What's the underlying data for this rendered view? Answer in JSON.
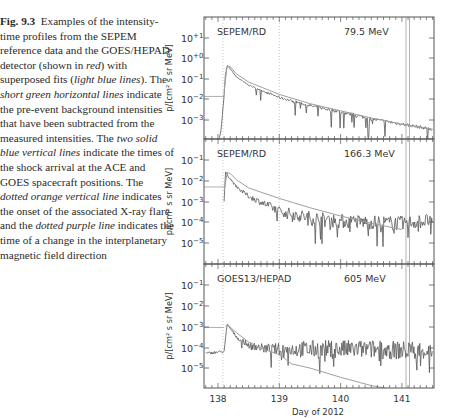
{
  "caption": {
    "label": "Fig. 9.3",
    "parts": [
      {
        "t": "Examples of the intensity-time profiles from the SEPEM reference data and the GOES/HEPAD detector (shown in ",
        "i": false
      },
      {
        "t": "red",
        "i": true
      },
      {
        "t": ") with superposed fits (",
        "i": false
      },
      {
        "t": "light blue lines",
        "i": true
      },
      {
        "t": "). The ",
        "i": false
      },
      {
        "t": "short green horizontal lines",
        "i": true
      },
      {
        "t": " indicate the pre-event background intensities that have been subtracted from the measured intensities. The ",
        "i": false
      },
      {
        "t": "two solid blue vertical lines",
        "i": true
      },
      {
        "t": " indicate the times of the shock arrival at the ACE and GOES spacecraft positions. The ",
        "i": false
      },
      {
        "t": "dotted orange vertical line",
        "i": true
      },
      {
        "t": " indicates the onset of the associated X-ray flare and the ",
        "i": false
      },
      {
        "t": "dotted purple line",
        "i": true
      },
      {
        "t": " indicates the time of a change in the interplanetary magnetic field direction",
        "i": false
      }
    ]
  },
  "chart_data": [
    {
      "type": "line",
      "title": "SEPEM/RD",
      "energy_label": "79.5 MeV",
      "xlabel": "Day of 2012",
      "ylabel": "p/[cm² s sr MeV]",
      "xlim": [
        137.75,
        141.55
      ],
      "ylim_log10": [
        -4,
        1.8
      ],
      "yticks": [
        "10^+1",
        "10^+0",
        "10^-1",
        "10^-2",
        "10^-3"
      ],
      "background_level_log10": -1.85,
      "series": [
        {
          "name": "measured",
          "x": [
            138.0,
            138.05,
            138.1,
            138.12,
            138.15,
            138.2,
            138.3,
            138.5,
            138.75,
            139.0,
            139.5,
            140.0,
            140.5,
            141.0,
            141.5
          ],
          "log10y": [
            -4.2,
            -3.5,
            -1.8,
            -0.8,
            -0.35,
            -0.5,
            -0.9,
            -1.3,
            -1.6,
            -1.9,
            -2.3,
            -2.6,
            -2.95,
            -3.2,
            -3.45
          ]
        },
        {
          "name": "fit",
          "x": [
            138.1,
            138.15,
            138.2,
            138.3,
            138.5,
            138.75,
            139.0,
            139.5,
            140.0,
            140.5,
            141.0,
            141.5
          ],
          "log10y": [
            -1.6,
            -0.35,
            -0.4,
            -0.75,
            -1.15,
            -1.45,
            -1.75,
            -2.2,
            -2.55,
            -2.9,
            -3.2,
            -3.45
          ]
        }
      ],
      "vlines": {
        "flare_onset": 138.08,
        "imf_change": 139.0,
        "shock_ace": 141.05,
        "shock_goes": 141.1
      }
    },
    {
      "type": "line",
      "title": "SEPEM/RD",
      "energy_label": "166.3 MeV",
      "xlabel": "Day of 2012",
      "ylabel": "p/[cm² s sr MeV]",
      "xlim": [
        137.75,
        141.55
      ],
      "ylim_log10": [
        -6.0,
        -0.05
      ],
      "yticks": [
        "10^-1",
        "10^-2",
        "10^-3",
        "10^-4",
        "10^-5"
      ],
      "background_level_log10": -2.3,
      "series": [
        {
          "name": "measured",
          "x": [
            138.1,
            138.12,
            138.15,
            138.2,
            138.3,
            138.5,
            138.75,
            139.0,
            139.5,
            140.0,
            140.5,
            141.0,
            141.5
          ],
          "log10y": [
            -3.0,
            -1.6,
            -1.7,
            -1.9,
            -2.3,
            -2.75,
            -3.1,
            -3.45,
            -3.8,
            -3.95,
            -4.0,
            -4.05,
            -3.9
          ]
        },
        {
          "name": "fit",
          "x": [
            138.1,
            138.15,
            138.2,
            138.3,
            138.5,
            138.75,
            139.0,
            139.5,
            140.0,
            140.5,
            141.0
          ],
          "log10y": [
            -2.5,
            -1.6,
            -1.65,
            -1.95,
            -2.35,
            -2.6,
            -2.85,
            -3.3,
            -3.7,
            -4.05,
            -4.35
          ]
        }
      ],
      "vlines": {
        "flare_onset": 138.08,
        "imf_change": 139.0,
        "shock_ace": 141.05,
        "shock_goes": 141.1
      }
    },
    {
      "type": "line",
      "title": "GOES13/HEPAD",
      "energy_label": "605 MeV",
      "xlabel": "Day of 2012",
      "ylabel": "p/[cm² s sr MeV]",
      "xlim": [
        137.75,
        141.55
      ],
      "ylim_log10": [
        -6.0,
        -0.05
      ],
      "yticks": [
        "10^-1",
        "10^-2",
        "10^-3",
        "10^-4",
        "10^-5"
      ],
      "xticks": [
        138,
        139,
        140,
        141
      ],
      "background_level_log10": -3.05,
      "series": [
        {
          "name": "measured",
          "x": [
            137.8,
            138.1,
            138.15,
            138.2,
            138.3,
            138.5,
            138.75,
            139.0,
            139.5,
            140.0,
            140.5,
            141.0,
            141.5
          ],
          "log10y": [
            -4.3,
            -4.2,
            -2.9,
            -3.1,
            -3.5,
            -3.9,
            -4.05,
            -4.1,
            -4.1,
            -4.1,
            -4.1,
            -4.15,
            -4.15
          ]
        },
        {
          "name": "fit",
          "x": [
            138.12,
            138.15,
            138.3,
            138.5,
            138.75,
            139.0,
            139.2,
            139.5,
            140.0,
            140.5,
            140.8
          ],
          "log10y": [
            -3.0,
            -2.9,
            -3.3,
            -3.75,
            -4.1,
            -4.35,
            -4.8,
            -5.0,
            -5.45,
            -5.85,
            -6.0
          ]
        }
      ],
      "vlines": {
        "flare_onset": 138.08,
        "imf_change": 139.0,
        "shock_ace": 141.05,
        "shock_goes": 141.1
      }
    }
  ]
}
